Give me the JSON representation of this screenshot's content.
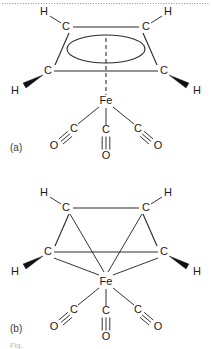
{
  "figure": {
    "background_color": "#ffffff",
    "bond_color": "#2b2b2b",
    "label_color": "#1a1a1a",
    "divider_color": "#8d8d8d",
    "caption_color": "#b9b9b9",
    "top_divider": "dotted-rule"
  },
  "panels": [
    {
      "id": "a",
      "label": "(a)",
      "description": "Delocalized representation: cyclobutadiene ring drawn with an inscribed ellipse denoting delocalised pi system, joined to Fe by a single dashed bond from the ring centroid.",
      "ring": {
        "type": "cyclobutadiene-delocalized",
        "centroid_symbol": "ellipse",
        "carbons": [
          {
            "id": "C1",
            "label": "C",
            "position": "top-left"
          },
          {
            "id": "C2",
            "label": "C",
            "position": "top-right"
          },
          {
            "id": "C3",
            "label": "C",
            "position": "bottom-right"
          },
          {
            "id": "C4",
            "label": "C",
            "position": "bottom-left"
          }
        ],
        "hydrogens": [
          {
            "id": "H1",
            "label": "H",
            "attached_to": "C1",
            "bond_style": "plain"
          },
          {
            "id": "H2",
            "label": "H",
            "attached_to": "C2",
            "bond_style": "plain"
          },
          {
            "id": "H3",
            "label": "H",
            "attached_to": "C3",
            "bond_style": "wedge"
          },
          {
            "id": "H4",
            "label": "H",
            "attached_to": "C4",
            "bond_style": "wedge"
          }
        ]
      },
      "metal": {
        "id": "Fe",
        "label": "Fe"
      },
      "metal_ring_bond": "dashed",
      "carbonyls": [
        {
          "id": "CO-left",
          "carbon_label": "C",
          "oxygen_label": "O",
          "order": "triple",
          "orientation": "down-left",
          "text_order": "O≡C"
        },
        {
          "id": "CO-center",
          "carbon_label": "C",
          "oxygen_label": "O",
          "order": "triple",
          "orientation": "down",
          "text_order": "C≡O"
        },
        {
          "id": "CO-right",
          "carbon_label": "C",
          "oxygen_label": "O",
          "order": "triple",
          "orientation": "down-right",
          "text_order": "C≡O"
        }
      ]
    },
    {
      "id": "b",
      "label": "(b)",
      "description": "Localized representation: each of the four cyclobutadiene carbons draws a separate sigma-type line down to the Fe centre.",
      "ring": {
        "type": "cyclobutadiene-localized",
        "centroid_symbol": "none",
        "carbons": [
          {
            "id": "C1",
            "label": "C",
            "position": "top-left"
          },
          {
            "id": "C2",
            "label": "C",
            "position": "top-right"
          },
          {
            "id": "C3",
            "label": "C",
            "position": "bottom-right"
          },
          {
            "id": "C4",
            "label": "C",
            "position": "bottom-left"
          }
        ],
        "hydrogens": [
          {
            "id": "H1",
            "label": "H",
            "attached_to": "C1",
            "bond_style": "plain"
          },
          {
            "id": "H2",
            "label": "H",
            "attached_to": "C2",
            "bond_style": "plain"
          },
          {
            "id": "H3",
            "label": "H",
            "attached_to": "C3",
            "bond_style": "wedge"
          },
          {
            "id": "H4",
            "label": "H",
            "attached_to": "C4",
            "bond_style": "wedge"
          }
        ]
      },
      "metal": {
        "id": "Fe",
        "label": "Fe"
      },
      "metal_ring_bond": "four-separate-lines",
      "carbonyls": [
        {
          "id": "CO-left",
          "carbon_label": "C",
          "oxygen_label": "O",
          "order": "triple",
          "orientation": "down-left",
          "text_order": "O≡C"
        },
        {
          "id": "CO-center",
          "carbon_label": "C",
          "oxygen_label": "O",
          "order": "triple",
          "orientation": "down",
          "text_order": "C≡O"
        },
        {
          "id": "CO-right",
          "carbon_label": "C",
          "oxygen_label": "O",
          "order": "triple",
          "orientation": "down-right",
          "text_order": "C≡O"
        }
      ]
    }
  ],
  "atoms": {
    "carbon": "C",
    "oxygen": "O",
    "hydrogen": "H",
    "iron": "Fe"
  },
  "caption": {
    "text": "Fig."
  }
}
